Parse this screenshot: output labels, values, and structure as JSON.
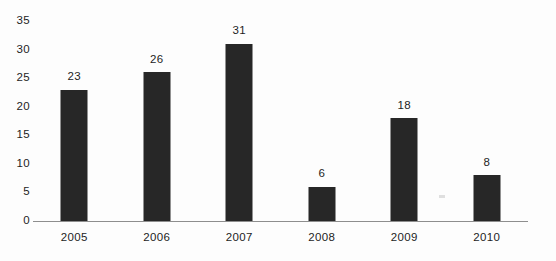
{
  "chart_data": {
    "type": "bar",
    "title": "",
    "subtitle": "",
    "xlabel": "",
    "ylabel": "",
    "categories": [
      "2005",
      "2006",
      "2007",
      "2008",
      "2009",
      "2010"
    ],
    "values": [
      23,
      26,
      31,
      6,
      18,
      8
    ],
    "data_labels": [
      "23",
      "26",
      "31",
      "6",
      "18",
      "8"
    ],
    "ylim": [
      0,
      35
    ],
    "ytick_values": [
      0,
      5,
      10,
      15,
      20,
      25,
      30,
      35
    ],
    "ytick_labels": [
      "0",
      "5",
      "10",
      "15",
      "20",
      "25",
      "30",
      "35"
    ],
    "grid": false,
    "legend": false,
    "legend_position": "none",
    "bar_color": "#272727",
    "axis_color": "#8e8e8e",
    "text_color": "#1d1d1d",
    "background_color": "#fdfdfd",
    "show_data_labels": true,
    "orientation": "vertical"
  }
}
